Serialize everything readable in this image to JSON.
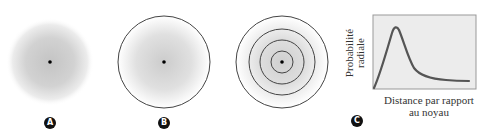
{
  "panels": [
    {
      "id": "A",
      "label": "A",
      "description": "diffuse electron cloud (gradient)"
    },
    {
      "id": "B",
      "label": "B",
      "description": "electron cloud with boundary circle"
    },
    {
      "id": "C",
      "label": "C",
      "description": "concentric shells and radial probability graph"
    }
  ],
  "graph": {
    "ylabel_line1": "Probabilité",
    "ylabel_line2": "radiale",
    "xlabel_line1": "Distance par rapport",
    "xlabel_line2": "au noyau"
  },
  "colors": {
    "cloud": "#c8c8c8",
    "stroke": "#444444",
    "plot_bg": "#ececec",
    "curve": "#555555",
    "badge": "#111111"
  }
}
